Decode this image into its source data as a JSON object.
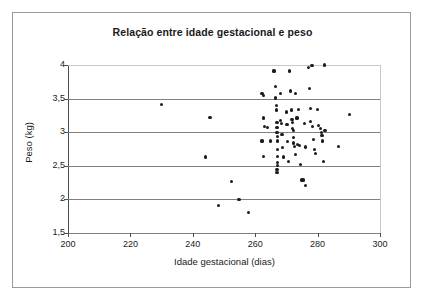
{
  "chart_data": {
    "type": "scatter",
    "title": "Relação entre idade gestacional e peso",
    "xlabel": "Idade gestacional (dias)",
    "ylabel": "Peso (kg)",
    "xlim": [
      200,
      300
    ],
    "ylim": [
      1.5,
      4.0
    ],
    "xticks": [
      "200",
      "220",
      "240",
      "260",
      "280",
      "300"
    ],
    "xtick_values": [
      200,
      220,
      240,
      260,
      280,
      300
    ],
    "yticks": [
      "1,5",
      "2",
      "2,5",
      "3",
      "3,5",
      "4"
    ],
    "ytick_values": [
      1.5,
      2.0,
      2.5,
      3.0,
      3.5,
      4.0
    ],
    "grid": "horizontal",
    "legend": "none",
    "marker": "filled-circle",
    "marker_color": "#1c1c1c",
    "points": [
      [
        230.0,
        3.41
      ],
      [
        245.5,
        3.22
      ],
      [
        244.0,
        2.63
      ],
      [
        248.2,
        1.91
      ],
      [
        252.4,
        2.27
      ],
      [
        254.8,
        2.0
      ],
      [
        257.8,
        1.81
      ],
      [
        262.2,
        3.57
      ],
      [
        262.6,
        3.55
      ],
      [
        262.6,
        3.21
      ],
      [
        262.2,
        2.87
      ],
      [
        262.6,
        2.64
      ],
      [
        263.0,
        3.09
      ],
      [
        264.0,
        3.07
      ],
      [
        265.0,
        2.87
      ],
      [
        266.0,
        3.91
      ],
      [
        266.4,
        3.68
      ],
      [
        266.4,
        3.52
      ],
      [
        266.6,
        3.5
      ],
      [
        266.8,
        3.4
      ],
      [
        266.8,
        3.33
      ],
      [
        267.0,
        3.14
      ],
      [
        267.0,
        3.07
      ],
      [
        267.0,
        3.0
      ],
      [
        267.2,
        2.94
      ],
      [
        267.2,
        2.87
      ],
      [
        267.2,
        2.74
      ],
      [
        267.2,
        2.64
      ],
      [
        267.2,
        2.55
      ],
      [
        267.2,
        2.51
      ],
      [
        267.0,
        2.44
      ],
      [
        267.0,
        2.4
      ],
      [
        268.0,
        3.58
      ],
      [
        268.2,
        3.18
      ],
      [
        268.4,
        3.13
      ],
      [
        268.6,
        2.96
      ],
      [
        268.8,
        2.77
      ],
      [
        269.0,
        2.63
      ],
      [
        270.0,
        3.3
      ],
      [
        270.2,
        3.11
      ],
      [
        270.4,
        2.86
      ],
      [
        270.6,
        2.57
      ],
      [
        271.0,
        3.91
      ],
      [
        271.2,
        3.62
      ],
      [
        271.4,
        3.6
      ],
      [
        271.6,
        3.33
      ],
      [
        271.8,
        3.19
      ],
      [
        272.0,
        3.14
      ],
      [
        272.0,
        3.05
      ],
      [
        272.2,
        3.02
      ],
      [
        272.4,
        2.92
      ],
      [
        272.4,
        2.84
      ],
      [
        272.6,
        2.79
      ],
      [
        272.8,
        2.67
      ],
      [
        273.0,
        3.57
      ],
      [
        273.4,
        3.21
      ],
      [
        273.6,
        2.82
      ],
      [
        274.0,
        3.34
      ],
      [
        274.2,
        2.8
      ],
      [
        274.4,
        2.52
      ],
      [
        275.0,
        2.29
      ],
      [
        275.4,
        2.29
      ],
      [
        275.8,
        3.13
      ],
      [
        276.0,
        2.21
      ],
      [
        276.2,
        2.78
      ],
      [
        277.0,
        3.96
      ],
      [
        277.4,
        3.65
      ],
      [
        277.6,
        3.35
      ],
      [
        277.8,
        3.16
      ],
      [
        278.2,
        3.99
      ],
      [
        278.4,
        3.09
      ],
      [
        278.6,
        2.89
      ],
      [
        279.0,
        2.74
      ],
      [
        279.4,
        2.68
      ],
      [
        280.0,
        3.34
      ],
      [
        280.4,
        3.1
      ],
      [
        281.0,
        3.05
      ],
      [
        281.2,
        2.99
      ],
      [
        281.4,
        2.95
      ],
      [
        281.6,
        2.87
      ],
      [
        281.8,
        2.57
      ],
      [
        282.2,
        4.0
      ],
      [
        282.4,
        3.03
      ],
      [
        286.6,
        2.79
      ],
      [
        290.2,
        3.26
      ]
    ]
  }
}
